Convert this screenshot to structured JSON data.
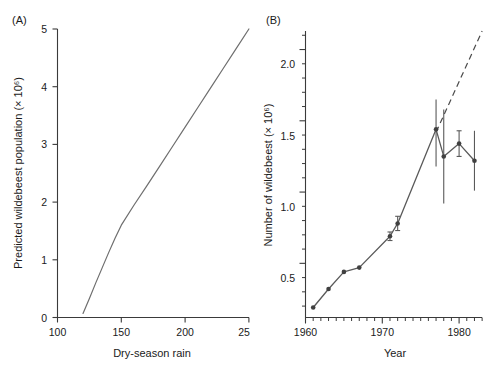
{
  "figure": {
    "background_color": "#ffffff",
    "width": 490,
    "height": 373
  },
  "panel_a": {
    "tag": "(A)",
    "xlabel": "Dry-season rain",
    "ylabel": "Predicted wildebeest population (× 10⁶)",
    "x_ticks": [
      "100",
      "150",
      "200",
      "250"
    ],
    "y_ticks": [
      "0",
      "1",
      "2",
      "3",
      "4",
      "5"
    ]
  },
  "panel_b": {
    "tag": "(B)",
    "xlabel": "Year",
    "ylabel": "Number of wildebeest (× 10⁶)",
    "x_ticks": [
      "1960",
      "1970",
      "1980"
    ],
    "y_ticks": [
      "0.5",
      "1.0",
      "1.5",
      "2.0"
    ]
  },
  "chart_data": [
    {
      "id": "panel-a",
      "type": "line",
      "title": "(A)",
      "xlabel": "Dry-season rain",
      "ylabel": "Predicted wildebeest population (× 10⁶)",
      "xlim": [
        100,
        250
      ],
      "ylim": [
        0,
        5
      ],
      "xticks": [
        100,
        150,
        200,
        250
      ],
      "yticks": [
        0,
        1,
        2,
        3,
        4,
        5
      ],
      "grid": false,
      "legend": "none",
      "line_color": "#6e6e6e",
      "series": [
        {
          "name": "Predicted population vs dry-season rain",
          "style": "solid",
          "x": [
            120,
            125,
            130,
            135,
            140,
            145,
            150,
            160,
            170,
            180,
            190,
            200,
            210,
            220,
            230,
            240,
            250
          ],
          "y": [
            0.07,
            0.33,
            0.6,
            0.86,
            1.12,
            1.37,
            1.6,
            1.95,
            2.28,
            2.62,
            2.96,
            3.3,
            3.64,
            3.98,
            4.32,
            4.66,
            5.0
          ]
        }
      ]
    },
    {
      "id": "panel-b",
      "type": "line",
      "title": "(B)",
      "xlabel": "Year",
      "ylabel": "Number of wildebeest (× 10⁶)",
      "xlim": [
        1960,
        1983
      ],
      "ylim": [
        0.12,
        2.13
      ],
      "xticks": [
        1960,
        1970,
        1980
      ],
      "xminorticks": [
        1961,
        1962,
        1963,
        1964,
        1965,
        1966,
        1967,
        1968,
        1969,
        1971,
        1972,
        1973,
        1974,
        1975,
        1976,
        1977,
        1978,
        1979,
        1981,
        1982,
        1983
      ],
      "yticks": [
        0.5,
        1.0,
        1.5,
        2.0
      ],
      "yminorticks": [
        0.2,
        0.3,
        0.4,
        0.6,
        0.7,
        0.8,
        0.9,
        1.1,
        1.2,
        1.3,
        1.4,
        1.6,
        1.7,
        1.8,
        1.9,
        2.1
      ],
      "grid": false,
      "legend": "none",
      "line_color": "#5a5a5a",
      "marker": "filled-circle",
      "series": [
        {
          "name": "Observed wildebeest count",
          "style": "solid-with-markers-and-errorbars",
          "x": [
            1961,
            1963,
            1965,
            1967,
            1971,
            1972,
            1977,
            1978,
            1980,
            1982
          ],
          "y": [
            0.19,
            0.32,
            0.44,
            0.47,
            0.69,
            0.78,
            1.44,
            1.25,
            1.34,
            1.22
          ],
          "yerr_low": [
            0.0,
            0.0,
            0.0,
            0.0,
            0.03,
            0.05,
            0.26,
            0.33,
            0.09,
            0.21
          ],
          "yerr_high": [
            0.0,
            0.0,
            0.0,
            0.0,
            0.03,
            0.05,
            0.21,
            0.33,
            0.09,
            0.21
          ]
        },
        {
          "name": "Projected trajectory",
          "style": "dashed",
          "x": [
            1977,
            1983
          ],
          "y": [
            1.42,
            2.13
          ]
        }
      ]
    }
  ]
}
